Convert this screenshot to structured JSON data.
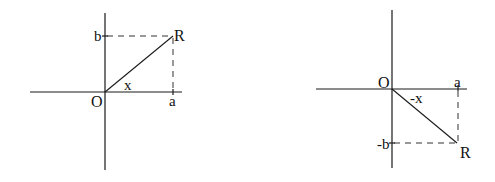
{
  "diagrams": [
    {
      "name": "first-quadrant",
      "labels": {
        "origin": "O",
        "point": "R",
        "x_foot": "a",
        "y_foot": "b",
        "angle": "x"
      }
    },
    {
      "name": "fourth-quadrant",
      "labels": {
        "origin": "O",
        "point": "R",
        "x_foot": "a",
        "y_foot": "-b",
        "angle": "-x"
      }
    }
  ],
  "colors": {
    "line": "#1a1a1a",
    "background": "#ffffff"
  }
}
